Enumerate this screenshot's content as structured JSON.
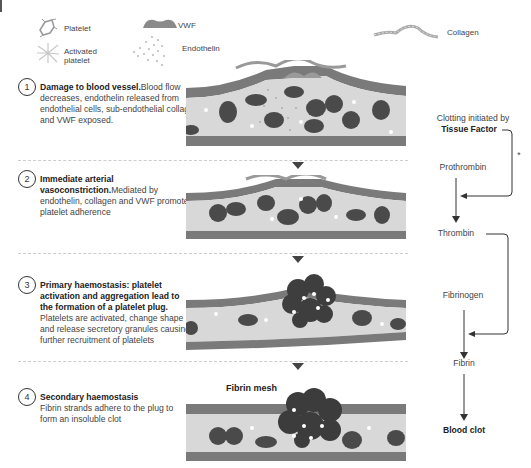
{
  "legend": {
    "items": [
      {
        "icon": "platelet-icon",
        "label": "Platelet"
      },
      {
        "icon": "activated-platelet-icon",
        "label": "Activated platelet"
      },
      {
        "icon": "vwf-icon",
        "label": "VWF"
      },
      {
        "icon": "endothelin-icon",
        "label": "Endothelin"
      },
      {
        "icon": "collagen-icon",
        "label": "Collagen"
      }
    ]
  },
  "steps": [
    {
      "number": "1",
      "title": "Damage to blood vessel.",
      "body": "Blood flow decreases, endothelin released from endothelial cells, sub-endothelial collagen and VWF exposed."
    },
    {
      "number": "2",
      "title": "Immediate arterial vasoconstriction.",
      "body": "Mediated by endothelin, collagen and VWF promote platelet adherence"
    },
    {
      "number": "3",
      "title": "Primary haemostasis: platelet activation  and aggregation lead to the formation of a platelet plug.",
      "body": " Platelets are activated, change shape and release secretory granules causing further recruitment of platelets"
    },
    {
      "number": "4",
      "title": "Secondary haemostasis",
      "body": "Fibrin strands adhere to the plug to form an insoluble clot"
    }
  ],
  "vessel_labels": {
    "fibrin_mesh": "Fibrin mesh"
  },
  "cascade": {
    "initiated_by": "Clotting initiated by",
    "tissue_factor": "Tissue Factor",
    "asterisk": "*",
    "prothrombin": "Prothrombin",
    "thrombin": "Thrombin",
    "fibrinogen": "Fibrinogen",
    "fibrin": "Fibrin",
    "blood_clot": "Blood clot"
  },
  "colors": {
    "vessel_wall": "#7a7a7a",
    "lumen": "#d8d8d8",
    "rbc": "#4a4a4a",
    "line": "#333333"
  }
}
